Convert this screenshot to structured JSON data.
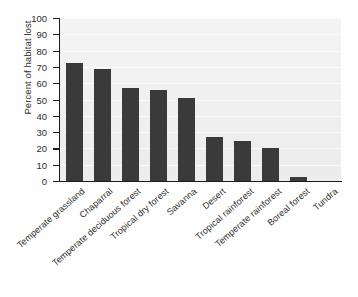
{
  "chart_data": {
    "type": "bar",
    "title": "",
    "xlabel": "",
    "ylabel": "Percent of habitat lost",
    "ylim": [
      0,
      100
    ],
    "yticks": [
      0,
      10,
      20,
      30,
      40,
      50,
      60,
      70,
      80,
      90,
      100
    ],
    "grid": true,
    "legend": null,
    "bar_color": "#3a3a3a",
    "plot_background": "#efefef",
    "axis_color": "#1c1c1c",
    "categories": [
      "Temperate grassland",
      "Chaparral",
      "Temperate deciduous forest",
      "Tropical dry forest",
      "Savanna",
      "Desert",
      "Tropical rainforest",
      "Temperate rainforest",
      "Boreal forest",
      "Tundra"
    ],
    "values": [
      72.5,
      69,
      57,
      56,
      51,
      27,
      24.5,
      20,
      2.5,
      0
    ]
  }
}
